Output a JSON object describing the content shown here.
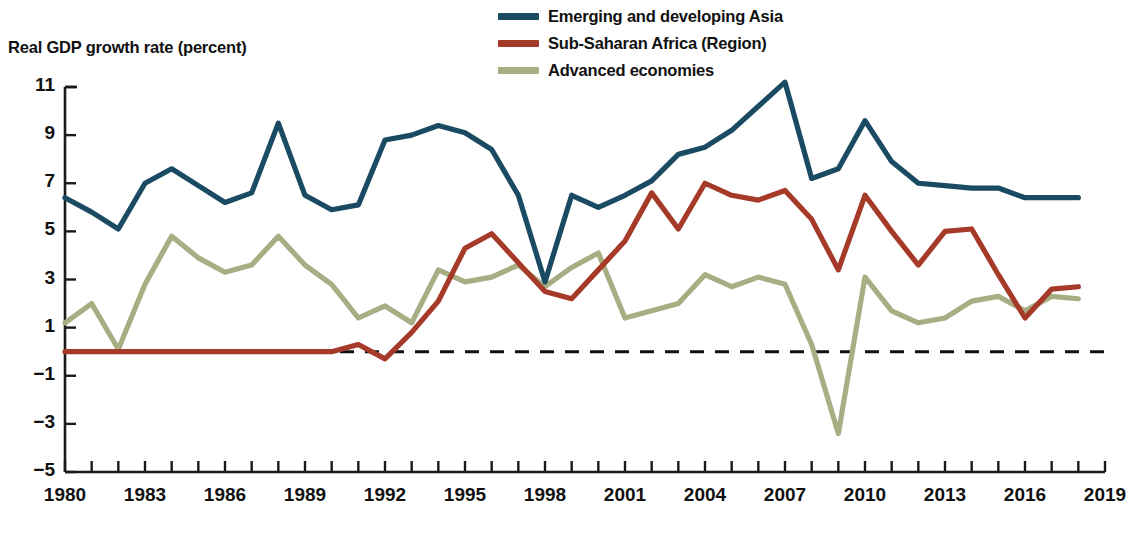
{
  "chart_data": {
    "type": "line",
    "title": "Real GDP growth rate (percent)",
    "xlabel": "",
    "ylabel": "Real GDP growth rate (percent)",
    "grid": false,
    "legend_position": "top-right",
    "xlim": [
      1980,
      2019
    ],
    "ylim": [
      -5,
      11
    ],
    "yticks": [
      11,
      9,
      7,
      5,
      3,
      1,
      -1,
      -3,
      -5
    ],
    "ytick_labels": [
      "11",
      "9",
      "7",
      "5",
      "3",
      "1",
      "−1",
      "−3",
      "−5"
    ],
    "xticks": [
      1980,
      1981,
      1982,
      1983,
      1984,
      1985,
      1986,
      1987,
      1988,
      1989,
      1990,
      1991,
      1992,
      1993,
      1994,
      1995,
      1996,
      1997,
      1998,
      1999,
      2000,
      2001,
      2002,
      2003,
      2004,
      2005,
      2006,
      2007,
      2008,
      2009,
      2010,
      2011,
      2012,
      2013,
      2014,
      2015,
      2016,
      2017,
      2018,
      2019
    ],
    "xtick_labels_shown": [
      "1980",
      "1983",
      "1986",
      "1989",
      "1992",
      "1995",
      "1998",
      "2001",
      "2004",
      "2007",
      "2010",
      "2013",
      "2016",
      "2019"
    ],
    "zero_reference_line": 0,
    "zero_line_style": "dashed",
    "x": [
      1980,
      1981,
      1982,
      1983,
      1984,
      1985,
      1986,
      1987,
      1988,
      1989,
      1990,
      1991,
      1992,
      1993,
      1994,
      1995,
      1996,
      1997,
      1998,
      1999,
      2000,
      2001,
      2002,
      2003,
      2004,
      2005,
      2006,
      2007,
      2008,
      2009,
      2010,
      2011,
      2012,
      2013,
      2014,
      2015,
      2016,
      2017,
      2018
    ],
    "series": [
      {
        "name": "Emerging and developing Asia",
        "color": "#1b4a63",
        "values": [
          6.4,
          5.8,
          5.1,
          7.0,
          7.6,
          6.9,
          6.2,
          6.6,
          9.5,
          6.5,
          5.9,
          6.1,
          8.8,
          9.0,
          9.4,
          9.1,
          8.4,
          6.5,
          2.9,
          6.5,
          6.0,
          6.5,
          7.1,
          8.2,
          8.5,
          9.2,
          10.2,
          11.2,
          7.2,
          7.6,
          9.6,
          7.9,
          7.0,
          6.9,
          6.8,
          6.8,
          6.4,
          6.4,
          6.4
        ]
      },
      {
        "name": "Sub-Saharan Africa (Region)",
        "color": "#a63a28",
        "values": [
          0.0,
          0.0,
          0.0,
          0.0,
          0.0,
          0.0,
          0.0,
          0.0,
          0.0,
          0.0,
          0.0,
          0.3,
          -0.3,
          0.8,
          2.1,
          4.3,
          4.9,
          3.7,
          2.5,
          2.2,
          3.4,
          4.6,
          6.6,
          5.1,
          7.0,
          6.5,
          6.3,
          6.7,
          5.5,
          3.4,
          6.5,
          5.0,
          3.6,
          5.0,
          5.1,
          3.2,
          1.4,
          2.6,
          2.7
        ]
      },
      {
        "name": "Advanced economies",
        "color": "#a8ae84",
        "values": [
          1.2,
          2.0,
          0.1,
          2.8,
          4.8,
          3.9,
          3.3,
          3.6,
          4.8,
          3.6,
          2.8,
          1.4,
          1.9,
          1.2,
          3.4,
          2.9,
          3.1,
          3.6,
          2.7,
          3.5,
          4.1,
          1.4,
          1.7,
          2.0,
          3.2,
          2.7,
          3.1,
          2.8,
          0.3,
          -3.4,
          3.1,
          1.7,
          1.2,
          1.4,
          2.1,
          2.3,
          1.7,
          2.3,
          2.2
        ]
      }
    ]
  },
  "legend": {
    "items": [
      {
        "label": "Emerging and developing Asia",
        "color": "#1b4a63"
      },
      {
        "label": "Sub-Saharan Africa (Region)",
        "color": "#a63a28"
      },
      {
        "label": "Advanced economies",
        "color": "#a8ae84"
      }
    ]
  },
  "axis": {
    "title": "Real GDP growth rate (percent)",
    "axis_color": "#1a1a1a"
  }
}
